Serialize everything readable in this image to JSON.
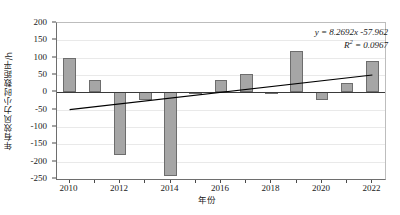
{
  "chart_data": {
    "type": "bar",
    "title": "",
    "subtitle": "",
    "xlabel": "年份",
    "ylabel": "年有效风力小时数距平/h",
    "categories": [
      2010,
      2011,
      2012,
      2013,
      2014,
      2015,
      2016,
      2017,
      2018,
      2019,
      2020,
      2021,
      2022
    ],
    "values": [
      100,
      37,
      -180,
      -23,
      -240,
      -2,
      37,
      52,
      1,
      120,
      -23,
      26,
      90
    ],
    "series": [
      {
        "name": "年有效风力小时数距平",
        "values": [
          100,
          37,
          -180,
          -23,
          -240,
          -2,
          37,
          52,
          1,
          120,
          -23,
          26,
          90
        ]
      }
    ],
    "ylim": [
      -250,
      200
    ],
    "ytick_values": [
      200,
      150,
      100,
      50,
      0,
      -50,
      -100,
      -150,
      -200,
      -250
    ],
    "ytick_labels": [
      "200",
      "150",
      "100",
      "50",
      "0",
      "-50",
      "-100",
      "-150",
      "-200",
      "-250"
    ],
    "xlim": [
      2009.5,
      2022.5
    ],
    "xtick_values": [
      2010,
      2012,
      2014,
      2016,
      2018,
      2020,
      2022
    ],
    "xtick_labels": [
      "2010",
      "2012",
      "2014",
      "2016",
      "2018",
      "2020",
      "2022"
    ],
    "grid": true,
    "legend": "none",
    "bar_color": "#a6a6a6",
    "bar_border_color": "#6d6d6d",
    "trendline": {
      "type": "linear",
      "slope": 8.2692,
      "intercept": -57.962,
      "color": "#000000",
      "x_start": 2010,
      "x_end": 2022,
      "y_start": -50,
      "y_end": 50
    },
    "annotations": {
      "equation": "y = 8.2692x -57.962",
      "r_squared_label": "R",
      "r_squared_exponent": "2",
      "r_squared_value": "= 0.0967"
    }
  }
}
